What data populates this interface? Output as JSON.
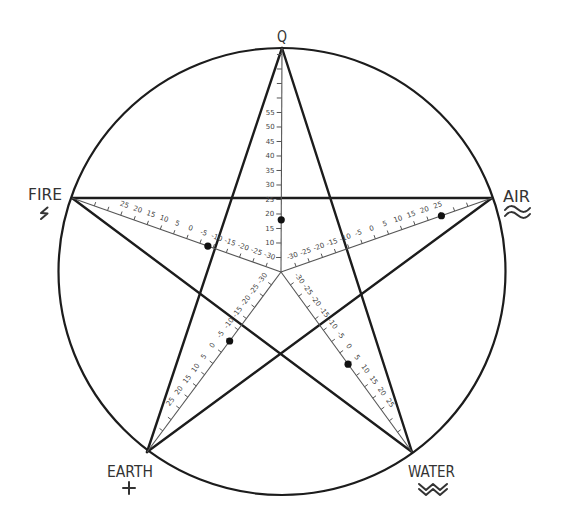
{
  "diagram": {
    "vertices": {
      "q": {
        "label": "Q"
      },
      "fire": {
        "label": "FIRE",
        "symbol": "lightning-icon"
      },
      "air": {
        "label": "AIR",
        "symbol": "double-wave-icon"
      },
      "earth": {
        "label": "EARTH",
        "symbol": "plus-icon"
      },
      "water": {
        "label": "WATER",
        "symbol": "zigzag-icon"
      }
    },
    "scales": [
      {
        "key": "q",
        "tick_min": 5,
        "tick_max": 75,
        "tick_step": 5,
        "labels": [
          10,
          15,
          20,
          25,
          30,
          35,
          40,
          45,
          50,
          55
        ],
        "marker_value": 18
      },
      {
        "key": "fire",
        "tick_min": -30,
        "tick_max": 35,
        "tick_step": 5,
        "labels": [
          -30,
          -25,
          -20,
          -15,
          -10,
          -5,
          0,
          5,
          10,
          15,
          20,
          25
        ],
        "marker_value": -8
      },
      {
        "key": "air",
        "tick_min": -30,
        "tick_max": 35,
        "tick_step": 5,
        "labels": [
          -30,
          -25,
          -20,
          -15,
          -10,
          -5,
          0,
          5,
          10,
          15,
          20,
          25
        ],
        "marker_value": 25
      },
      {
        "key": "earth",
        "tick_min": -30,
        "tick_max": 35,
        "tick_step": 5,
        "labels": [
          -30,
          -25,
          -20,
          -15,
          -10,
          -5,
          0,
          5,
          10,
          15,
          20,
          25
        ],
        "marker_value": -5
      },
      {
        "key": "water",
        "tick_min": -30,
        "tick_max": 35,
        "tick_step": 5,
        "labels": [
          -30,
          -25,
          -20,
          -15,
          -10,
          -5,
          0,
          5,
          10,
          15,
          20,
          25
        ],
        "marker_value": 5
      }
    ],
    "colors": {
      "line": "#1c1c1c",
      "scale": "#555555",
      "text": "#333333",
      "marker": "#111111",
      "background": "#ffffff"
    }
  }
}
